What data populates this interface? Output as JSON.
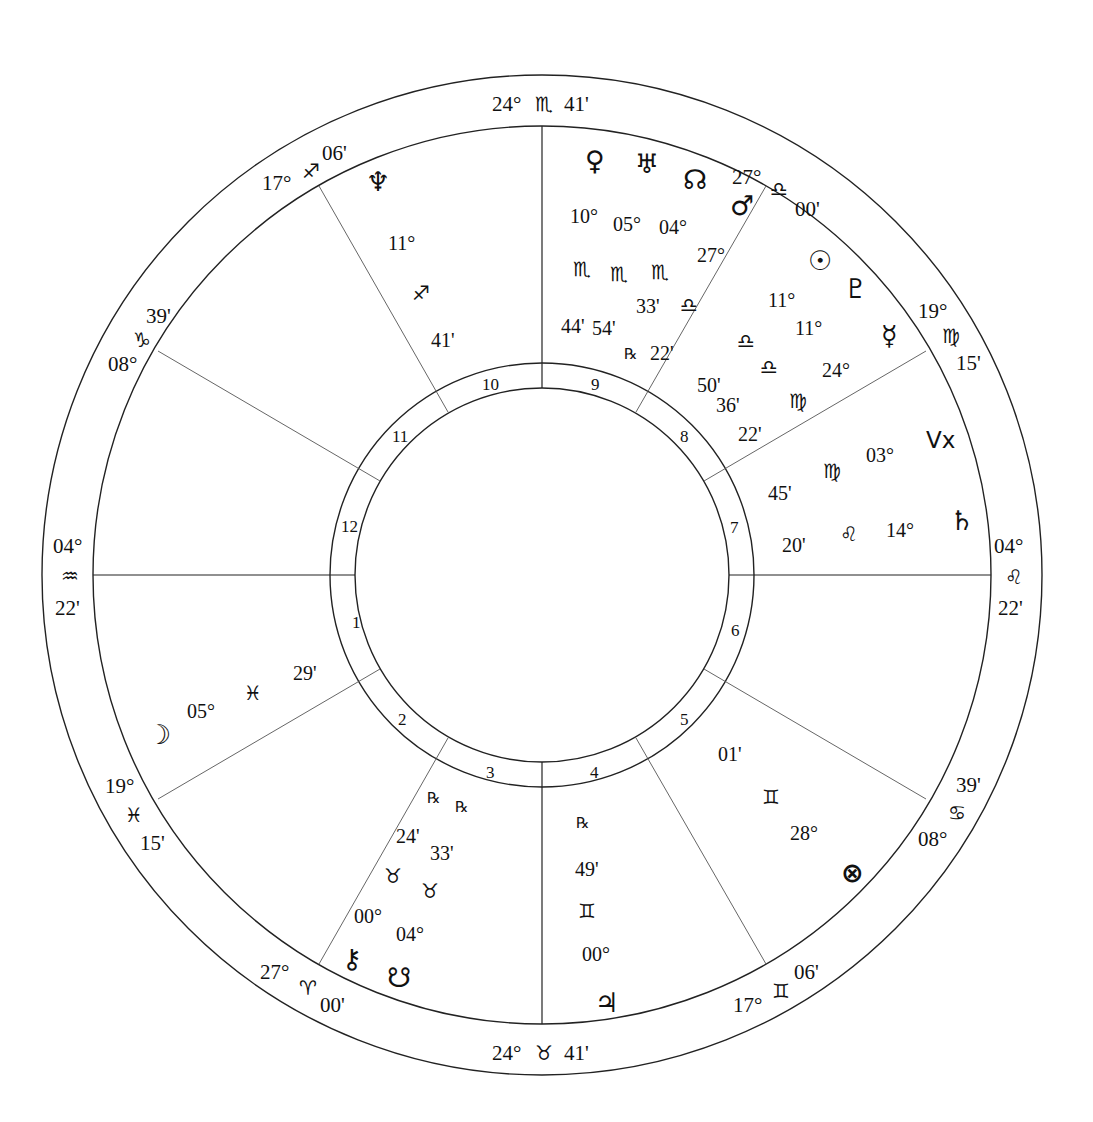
{
  "chart": {
    "center": [
      542,
      575
    ],
    "radii": {
      "outer": 500,
      "zodiac_inner": 448,
      "house_ring_outer": 212,
      "house_ring_inner": 186
    },
    "line_color": "#222222"
  },
  "cusps": {
    "mc": {
      "deg": "24°",
      "sign": "♏",
      "min": "41'"
    },
    "ic": {
      "deg": "24°",
      "sign": "♉",
      "min": "41'"
    },
    "asc": {
      "deg": "04°",
      "sign": "♒",
      "min": "22'"
    },
    "dsc": {
      "deg": "04°",
      "sign": "♌",
      "min": "22'"
    },
    "c11": {
      "deg": "17°",
      "sign": "♐",
      "min": "06'"
    },
    "c12": {
      "deg": "08°",
      "sign": "♑",
      "min": "39'"
    },
    "c9": {
      "deg": "27°",
      "sign": "♎",
      "min": "00'"
    },
    "c8": {
      "deg": "19°",
      "sign": "♍",
      "min": "15'"
    },
    "c2": {
      "deg": "19°",
      "sign": "♓",
      "min": "15'"
    },
    "c3": {
      "deg": "27°",
      "sign": "♈",
      "min": "00'"
    },
    "c5": {
      "deg": "17°",
      "sign": "♊",
      "min": "06'"
    },
    "c6": {
      "deg": "08°",
      "sign": "♋",
      "min": "39'"
    }
  },
  "houses": [
    "1",
    "2",
    "3",
    "4",
    "5",
    "6",
    "7",
    "8",
    "9",
    "10",
    "11",
    "12"
  ],
  "planets": {
    "neptune": {
      "glyph": "♆",
      "deg": "11°",
      "sign": "♐",
      "min": "41'"
    },
    "venus": {
      "glyph": "♀",
      "deg": "10°",
      "sign": "♏",
      "min": "44'"
    },
    "uranus": {
      "glyph": "♅",
      "deg": "05°",
      "sign": "♏",
      "min": "54'",
      "retro": "℞"
    },
    "node": {
      "glyph": "☊",
      "deg": "04°",
      "sign": "♏",
      "min": "33'"
    },
    "mars": {
      "glyph": "♂",
      "deg": "27°",
      "sign": "♎",
      "min": "22'"
    },
    "sun": {
      "glyph": "☉",
      "deg": "11°",
      "sign": "♎",
      "min": "50'"
    },
    "pluto": {
      "glyph": "♇",
      "deg": "11°",
      "sign": "♎",
      "min": "36'"
    },
    "mercury": {
      "glyph": "☿",
      "deg": "24°",
      "sign": "♍",
      "min": "22'"
    },
    "vertex": {
      "glyph": "Vx",
      "deg": "03°",
      "sign": "♍",
      "min": "45'"
    },
    "saturn": {
      "glyph": "♄",
      "deg": "14°",
      "sign": "♌",
      "min": "20'"
    },
    "fortune": {
      "glyph": "⊗",
      "deg": "28°",
      "sign": "♊",
      "min": "01'"
    },
    "jupiter": {
      "glyph": "♃",
      "deg": "00°",
      "sign": "♊",
      "min": "49'",
      "retro": "℞"
    },
    "chiron": {
      "glyph": "⚷",
      "deg": "00°",
      "sign": "♉",
      "min": "24'",
      "retro": "℞"
    },
    "snode": {
      "glyph": "☋",
      "deg": "04°",
      "sign": "♉",
      "min": "33'",
      "retro": "℞"
    },
    "moon": {
      "glyph": "☽",
      "deg": "05°",
      "sign": "♓",
      "min": "29'"
    }
  }
}
